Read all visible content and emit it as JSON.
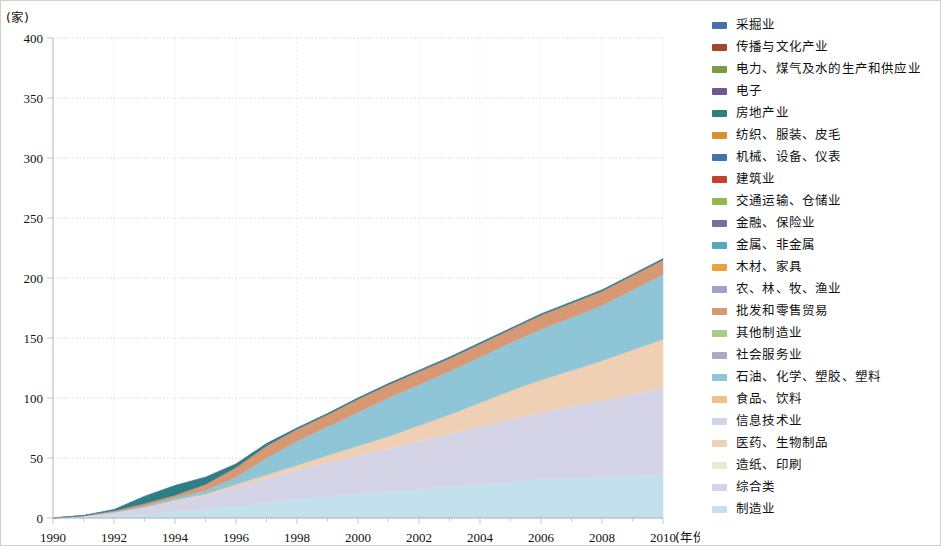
{
  "chart_data": {
    "type": "area",
    "stacked": true,
    "title": "",
    "xlabel": "(年份)",
    "ylabel": "(家)",
    "ylim": [
      0,
      400
    ],
    "xlim": [
      1990,
      2010
    ],
    "ytick_labels": [
      "0",
      "50",
      "100",
      "150",
      "200",
      "250",
      "300",
      "350",
      "400"
    ],
    "yticks": [
      0,
      50,
      100,
      150,
      200,
      250,
      300,
      350,
      400
    ],
    "xtick_labels": [
      "1990",
      "1992",
      "1994",
      "1996",
      "1998",
      "2000",
      "2002",
      "2004",
      "2006",
      "2008",
      "2010"
    ],
    "xticks": [
      1990,
      1992,
      1994,
      1996,
      1998,
      2000,
      2002,
      2004,
      2006,
      2008,
      2010
    ],
    "grid": true,
    "legend_position": "right",
    "x": [
      1990,
      1991,
      1992,
      1993,
      1994,
      1995,
      1996,
      1997,
      1998,
      1999,
      2000,
      2001,
      2002,
      2003,
      2004,
      2005,
      2006,
      2007,
      2008,
      2009,
      2010
    ],
    "series": [
      {
        "name": "采掘业",
        "color": "#4472a8",
        "values": [
          0,
          0,
          0,
          0,
          0,
          0,
          0,
          0,
          0,
          0,
          0,
          0,
          0,
          0,
          0,
          0,
          0,
          0,
          0,
          0,
          0
        ]
      },
      {
        "name": "传播与文化产业",
        "color": "#a3472c",
        "values": [
          0,
          0,
          0,
          0,
          0,
          0,
          0,
          0,
          0,
          0,
          0,
          0,
          0,
          0,
          0,
          0,
          0,
          0,
          0,
          0,
          0
        ]
      },
      {
        "name": "电力、煤气及水的生产和供应业",
        "color": "#7b9c44",
        "values": [
          0,
          0,
          0,
          0,
          0,
          0,
          0,
          0,
          0,
          0,
          0,
          0,
          0,
          0,
          0,
          0,
          0,
          0,
          0,
          0,
          0
        ]
      },
      {
        "name": "电子",
        "color": "#6c5b8c",
        "values": [
          0,
          0,
          0,
          0,
          0,
          0,
          0,
          0,
          0,
          0,
          0,
          0,
          0,
          0,
          0,
          0,
          0,
          0,
          0,
          0,
          0
        ]
      },
      {
        "name": "房地产业",
        "color": "#2e7f85",
        "values": [
          0,
          0,
          1,
          6,
          8,
          6,
          3,
          2,
          1,
          1,
          1,
          1,
          1,
          1,
          1,
          1,
          1,
          1,
          1,
          1,
          1
        ]
      },
      {
        "name": "纺织、服装、皮毛",
        "color": "#d9902f",
        "values": [
          0,
          0,
          0,
          0,
          0,
          0,
          0,
          0,
          0,
          0,
          0,
          0,
          0,
          0,
          0,
          0,
          0,
          0,
          0,
          0,
          0
        ]
      },
      {
        "name": "机械、设备、仪表",
        "color": "#4472a8",
        "values": [
          0,
          0,
          0,
          0,
          0,
          0,
          0,
          0,
          0,
          0,
          0,
          0,
          0,
          0,
          0,
          0,
          0,
          0,
          0,
          0,
          0
        ]
      },
      {
        "name": "建筑业",
        "color": "#c0452e",
        "values": [
          0,
          0,
          0,
          0,
          0,
          0,
          0,
          0,
          0,
          0,
          0,
          0,
          0,
          0,
          0,
          0,
          0,
          0,
          0,
          0,
          0
        ]
      },
      {
        "name": "交通运输、仓储业",
        "color": "#94b84e",
        "values": [
          0,
          0,
          0,
          0,
          0,
          0,
          0,
          0,
          0,
          0,
          0,
          0,
          0,
          0,
          0,
          0,
          0,
          0,
          0,
          0,
          0
        ]
      },
      {
        "name": "金融、保险业",
        "color": "#7a6f9b",
        "values": [
          0,
          0,
          0,
          0,
          0,
          0,
          0,
          0,
          0,
          0,
          0,
          0,
          0,
          0,
          0,
          0,
          0,
          0,
          0,
          0,
          0
        ]
      },
      {
        "name": "金属、非金属",
        "color": "#5aa8bd",
        "values": [
          0,
          0,
          0,
          0,
          0,
          0,
          0,
          0,
          0,
          0,
          0,
          0,
          0,
          0,
          0,
          0,
          0,
          0,
          0,
          0,
          0
        ]
      },
      {
        "name": "木材、家具",
        "color": "#e8a33d",
        "values": [
          0,
          0,
          0,
          0,
          0,
          0,
          0,
          0,
          0,
          0,
          0,
          0,
          0,
          0,
          0,
          0,
          0,
          0,
          0,
          0,
          0
        ]
      },
      {
        "name": "农、林、牧、渔业",
        "color": "#9aa3cc",
        "values": [
          0,
          0,
          0,
          0,
          0,
          0,
          0,
          0,
          0,
          0,
          0,
          0,
          0,
          0,
          0,
          0,
          0,
          0,
          0,
          0,
          0
        ]
      },
      {
        "name": "批发和零售贸易",
        "color": "#d99874",
        "values": [
          0,
          0,
          1,
          2,
          2,
          5,
          8,
          10,
          10,
          10,
          11,
          11,
          11,
          11,
          11,
          11,
          12,
          12,
          12,
          12,
          12
        ]
      },
      {
        "name": "其他制造业",
        "color": "#a9cc89",
        "values": [
          0,
          0,
          0,
          0,
          0,
          0,
          0,
          0,
          0,
          0,
          0,
          0,
          0,
          0,
          0,
          0,
          0,
          0,
          0,
          0,
          0
        ]
      },
      {
        "name": "社会服务业",
        "color": "#a9a9c8",
        "values": [
          0,
          0,
          0,
          0,
          0,
          0,
          0,
          0,
          0,
          0,
          0,
          0,
          0,
          0,
          0,
          0,
          0,
          0,
          0,
          0,
          0
        ]
      },
      {
        "name": "石油、化学、塑胶、塑料",
        "color": "#8ec6d8",
        "values": [
          0,
          0,
          0,
          1,
          2,
          3,
          6,
          14,
          20,
          24,
          28,
          32,
          34,
          36,
          38,
          40,
          42,
          44,
          46,
          50,
          54
        ]
      },
      {
        "name": "食品、饮料",
        "color": "#f2c08a",
        "values": [
          0,
          0,
          0,
          0,
          0,
          0,
          0,
          0,
          0,
          0,
          0,
          0,
          0,
          0,
          0,
          0,
          0,
          0,
          0,
          0,
          0
        ]
      },
      {
        "name": "信息技术业",
        "color": "#cdd6ea",
        "values": [
          0,
          0,
          0,
          0,
          0,
          0,
          0,
          0,
          0,
          0,
          0,
          0,
          0,
          0,
          0,
          0,
          0,
          0,
          0,
          0,
          0
        ]
      },
      {
        "name": "医药、生物制品",
        "color": "#f0d0b4",
        "values": [
          0,
          0,
          0,
          0,
          1,
          1,
          2,
          3,
          4,
          6,
          8,
          10,
          13,
          16,
          20,
          24,
          27,
          30,
          33,
          37,
          41
        ]
      },
      {
        "name": "造纸、印刷",
        "color": "#e9ecc8",
        "values": [
          0,
          0,
          0,
          0,
          0,
          0,
          0,
          0,
          0,
          0,
          0,
          0,
          0,
          0,
          0,
          0,
          0,
          0,
          0,
          0,
          0
        ]
      },
      {
        "name": "综合类",
        "color": "#d5d4e6",
        "values": [
          0,
          1,
          3,
          6,
          9,
          12,
          16,
          20,
          24,
          28,
          32,
          36,
          40,
          44,
          48,
          52,
          56,
          60,
          64,
          68,
          72
        ]
      },
      {
        "name": "制造业",
        "color": "#c2e1ec",
        "values": [
          0,
          1,
          2,
          3,
          5,
          7,
          10,
          13,
          16,
          18,
          20,
          22,
          24,
          26,
          28,
          30,
          32,
          33,
          34,
          35,
          36
        ]
      }
    ],
    "stack_order_bottom_to_top": [
      "制造业",
      "综合类",
      "医药、生物制品",
      "石油、化学、塑胶、塑料",
      "批发和零售贸易",
      "房地产业",
      "采掘业"
    ],
    "totals": [
      0,
      2,
      7,
      18,
      27,
      34,
      45,
      62,
      78,
      94,
      112,
      130,
      148,
      163,
      178,
      188,
      196,
      213,
      240,
      288,
      358
    ]
  },
  "legend": {
    "items": [
      {
        "label": "采掘业",
        "color": "#4472a8"
      },
      {
        "label": "传播与文化产业",
        "color": "#a3472c"
      },
      {
        "label": "电力、煤气及水的生产和供应业",
        "color": "#7b9c44"
      },
      {
        "label": "电子",
        "color": "#6c5b8c"
      },
      {
        "label": "房地产业",
        "color": "#2e7f85"
      },
      {
        "label": "纺织、服装、皮毛",
        "color": "#d9902f"
      },
      {
        "label": "机械、设备、仪表",
        "color": "#4472a8"
      },
      {
        "label": "建筑业",
        "color": "#c0452e"
      },
      {
        "label": "交通运输、仓储业",
        "color": "#94b84e"
      },
      {
        "label": "金融、保险业",
        "color": "#7a6f9b"
      },
      {
        "label": "金属、非金属",
        "color": "#5aa8bd"
      },
      {
        "label": "木材、家具",
        "color": "#e8a33d"
      },
      {
        "label": "农、林、牧、渔业",
        "color": "#9aa3cc"
      },
      {
        "label": "批发和零售贸易",
        "color": "#d99874"
      },
      {
        "label": "其他制造业",
        "color": "#a9cc89"
      },
      {
        "label": "社会服务业",
        "color": "#a9a9c8"
      },
      {
        "label": "石油、化学、塑胶、塑料",
        "color": "#8ec6d8"
      },
      {
        "label": "食品、饮料",
        "color": "#f2c08a"
      },
      {
        "label": "信息技术业",
        "color": "#cdd6ea"
      },
      {
        "label": "医药、生物制品",
        "color": "#f0d0b4"
      },
      {
        "label": "造纸、印刷",
        "color": "#e9ecc8"
      },
      {
        "label": "综合类",
        "color": "#d5d4e6"
      },
      {
        "label": "制造业",
        "color": "#c2e1ec"
      }
    ]
  }
}
